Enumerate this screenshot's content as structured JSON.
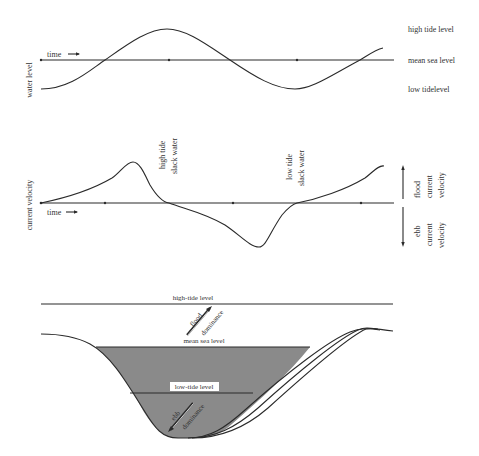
{
  "panel1": {
    "ylabel": "water level",
    "time_label": "time",
    "levels": {
      "high": "high tide level",
      "mean": "mean sea level",
      "low": "low tidelevel"
    }
  },
  "panel2": {
    "ylabel": "current velocity",
    "time_label": "time",
    "annotations": {
      "high_slack_1": "high tide",
      "high_slack_2": "slack water",
      "low_slack_1": "low tide",
      "low_slack_2": "slack water"
    },
    "flood": [
      "flood",
      "current",
      "velocity"
    ],
    "ebb": [
      "ebb",
      "current",
      "velocity"
    ]
  },
  "panel3": {
    "high_tide_level": "high-tide level",
    "mean_sea_level": "mean sea level",
    "low_tide_level": "low-tide level",
    "flood_arrow": [
      "flood",
      "dominance"
    ],
    "ebb_arrow": [
      "ebb",
      "dominance"
    ],
    "water_fill_color": "#8a8a8a"
  }
}
